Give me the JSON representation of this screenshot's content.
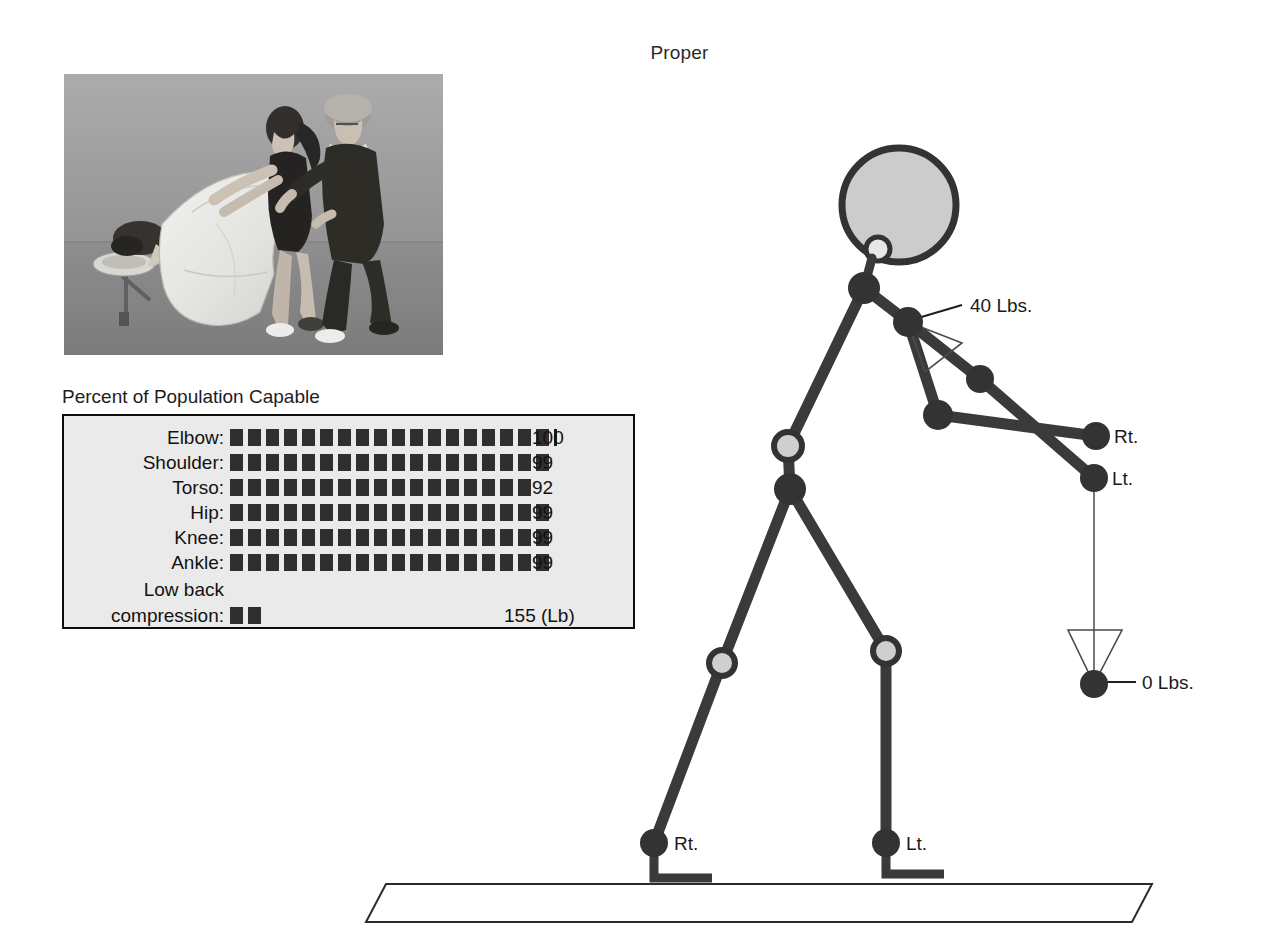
{
  "title": "Proper",
  "photo": {
    "caption_alt": "Massage therapy lifting demonstration photograph",
    "name": "lifting-demonstration-photo"
  },
  "capability_panel": {
    "heading": "Percent of Population Capable",
    "rows": [
      {
        "label": "Elbow:",
        "value": "100",
        "blocks": 18,
        "tick": true
      },
      {
        "label": "Shoulder:",
        "value": "99",
        "blocks": 18,
        "tick": false
      },
      {
        "label": "Torso:",
        "value": "92",
        "blocks": 17,
        "tick": false
      },
      {
        "label": "Hip:",
        "value": "99",
        "blocks": 18,
        "tick": false
      },
      {
        "label": "Knee:",
        "value": "99",
        "blocks": 18,
        "tick": false
      },
      {
        "label": "Ankle:",
        "value": "99",
        "blocks": 18,
        "tick": false
      }
    ],
    "lowback": {
      "label_line1": "Low back",
      "label_line2": "compression:",
      "blocks": 2,
      "value": "155 (Lb)"
    }
  },
  "figure": {
    "labels": {
      "hand_load": "40 Lbs.",
      "hand_right": "Rt.",
      "hand_left": "Lt.",
      "weight_load": "0 Lbs.",
      "foot_right": "Rt.",
      "foot_left": "Lt."
    },
    "colors": {
      "limb": "#3a3a3a",
      "joint_dark": "#333333",
      "joint_light": "#cfcfcf",
      "head_fill": "#cccccc",
      "outline": "#333333",
      "ground": "#2b2b2b"
    }
  },
  "chart_data": {
    "type": "bar",
    "title": "Percent of Population Capable",
    "categories": [
      "Elbow",
      "Shoulder",
      "Torso",
      "Hip",
      "Knee",
      "Ankle",
      "Low back compression"
    ],
    "values": [
      100,
      99,
      92,
      99,
      99,
      99,
      155
    ],
    "value_labels": [
      "100",
      "99",
      "92",
      "99",
      "99",
      "99",
      "155 (Lb)"
    ],
    "units": [
      "%",
      "%",
      "%",
      "%",
      "%",
      "%",
      "Lb"
    ],
    "xlabel": "",
    "ylabel": "",
    "xlim": [
      0,
      100
    ],
    "grid": false,
    "legend": "none"
  }
}
